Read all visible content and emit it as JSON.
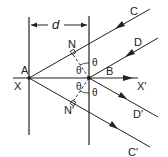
{
  "diagram": {
    "labels": {
      "A": "A",
      "B": "B",
      "X": "X",
      "X_prime": "X′",
      "C": "C",
      "D": "D",
      "C_prime": "C′",
      "D_prime": "D′",
      "N": "N",
      "N_prime": "N′",
      "d": "d",
      "theta_1": "θ",
      "theta_2": "θ",
      "theta_3": "θ",
      "theta_4": "θ",
      "theta_5": "θ"
    },
    "colors": {
      "line": "#222222",
      "background": "#ffffff"
    }
  }
}
